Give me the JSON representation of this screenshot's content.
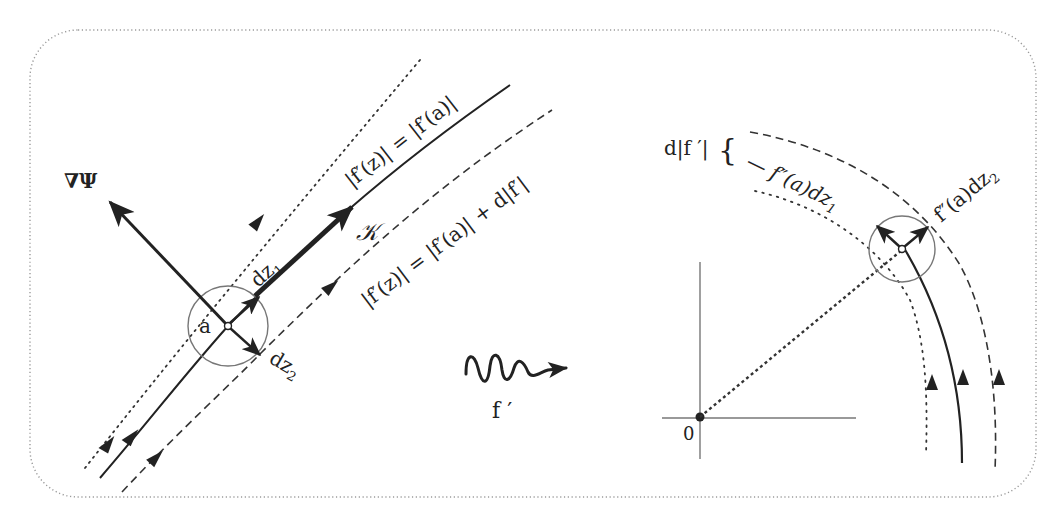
{
  "diagram": {
    "left_panel": {
      "point_label": "a",
      "gradient_label": "∇Ψ",
      "tangent_label": "𝒦",
      "dz1_label": "dz",
      "dz1_sub": "1",
      "dz2_label": "dz",
      "dz2_sub": "2",
      "solid_curve_label": "|f′(z)| = |f′(a)|",
      "dashed_curve_label": "|f′(z)| = |f′(a)| + d|f′|"
    },
    "mapping": {
      "label": "f ′"
    },
    "right_panel": {
      "origin_label": "0",
      "brace_label": "d|f ′|",
      "brace_glyph": "{",
      "dz1_image_label": "— f″(a)dz",
      "dz1_image_sub": "1",
      "dz2_image_label": "f″(a)dz",
      "dz2_image_sub": "2"
    },
    "colors": {
      "stroke": "#222222",
      "frame": "#9a9a9a",
      "circle": "#777777"
    }
  }
}
